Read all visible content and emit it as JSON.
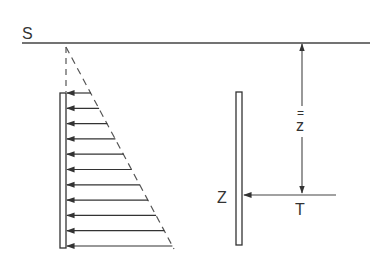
{
  "diagram": {
    "labels": {
      "surface": "S",
      "depth_symbol": "z",
      "depth_mark": "=",
      "point": "Z",
      "force": "T"
    },
    "colors": {
      "line": "#444444",
      "dashed": "#555555",
      "background": "#ffffff"
    },
    "surface_line": {
      "x1": 22,
      "x2": 370,
      "y": 43
    },
    "load_triangle": {
      "apex": [
        66,
        46
      ],
      "base_end": [
        174,
        249
      ],
      "arrow_count": 11,
      "arrow_y_start": 93,
      "arrow_y_end": 246
    },
    "left_wall": {
      "x": 60,
      "y": 93,
      "width": 6,
      "height": 155
    },
    "right_wall": {
      "x": 236,
      "y": 92,
      "width": 6,
      "height": 153
    },
    "dimension": {
      "x": 302,
      "y_top": 44,
      "y_bottom": 193
    },
    "force_arrow": {
      "x_from": 336,
      "x_to": 243,
      "y": 195
    }
  }
}
